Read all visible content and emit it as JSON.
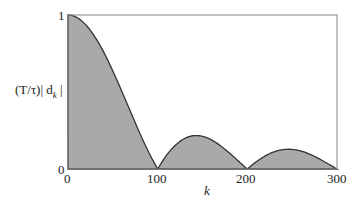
{
  "chart_data": {
    "type": "area",
    "title": "",
    "xlabel": "k",
    "ylabel": "(T/τ)| d_k |",
    "xlim": [
      0,
      300
    ],
    "ylim": [
      0,
      1
    ],
    "x_ticks": [
      "0",
      "100",
      "200",
      "300"
    ],
    "y_ticks": [
      "0",
      "1"
    ],
    "grid": false,
    "legend": null,
    "fill_color": "#a8a8a8",
    "line_color": "#333333",
    "series": [
      {
        "name": "|sinc(k/100)|",
        "x": [
          0,
          25,
          50,
          75,
          100,
          125,
          150,
          175,
          200,
          225,
          250,
          275,
          300
        ],
        "values": [
          1.0,
          0.9,
          0.64,
          0.3,
          0.0,
          0.18,
          0.21,
          0.13,
          0.0,
          0.1,
          0.127,
          0.08,
          0.0
        ]
      }
    ]
  },
  "labels": {
    "y_top": "1",
    "y_bottom": "0",
    "x0": "0",
    "x100": "100",
    "x200": "200",
    "x300": "300",
    "xlabel": "k",
    "ylabel_prefix": "(T/τ)| d",
    "ylabel_sub": "k",
    "ylabel_suffix": " |"
  }
}
